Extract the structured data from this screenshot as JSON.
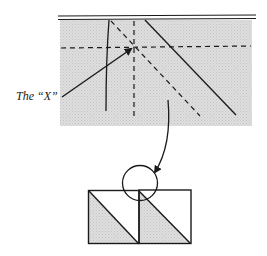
{
  "diagram": {
    "label_x": "The “X”",
    "colors": {
      "ink": "#1a1a1a",
      "shade": "#d9d9d9",
      "background": "#ffffff"
    },
    "top_panel": {
      "description": "Shaded fold panel with crease lines forming an X",
      "elements": [
        "double-top-edge",
        "horizontal-dashed-crease",
        "vertical-dashed-crease",
        "diagonal-dashed-crease",
        "solid-vertical-line",
        "solid-diagonal-line",
        "x-pointer-arrow"
      ]
    },
    "bottom_panel": {
      "description": "Two squares each with a shaded diagonal triangle; circle highlights the junction",
      "elements": [
        "left-square",
        "right-square",
        "left-shaded-triangle",
        "right-shaded-triangle",
        "highlight-circle"
      ]
    },
    "connector": "curved-arrow"
  }
}
